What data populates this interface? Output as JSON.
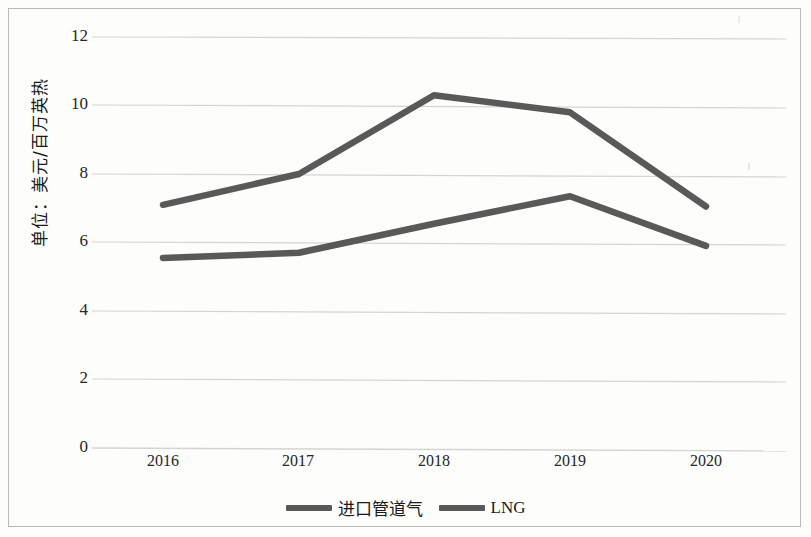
{
  "chart_data": {
    "type": "line",
    "title": "",
    "xlabel": "",
    "ylabel": "单位：美元/百万英热",
    "categories": [
      "2016",
      "2017",
      "2018",
      "2019",
      "2020"
    ],
    "ylim": [
      0,
      12
    ],
    "yticks": [
      0,
      2,
      4,
      6,
      8,
      10,
      12
    ],
    "ytick_labels": [
      "0",
      "2",
      "4",
      "6",
      "8",
      "10",
      "12"
    ],
    "grid": true,
    "legend_position": "bottom",
    "series": [
      {
        "name": "进口管道气",
        "color": "#595959",
        "values": [
          5.55,
          5.7,
          6.55,
          7.35,
          5.9
        ]
      },
      {
        "name": "LNG",
        "color": "#595959",
        "values": [
          7.1,
          8.0,
          10.3,
          9.8,
          7.05
        ]
      }
    ]
  },
  "axis": {
    "y_label_text": "单位：美元/百万英热",
    "y_tick_0": "0",
    "y_tick_2": "2",
    "y_tick_4": "4",
    "y_tick_6": "6",
    "y_tick_8": "8",
    "y_tick_10": "10",
    "y_tick_12": "12",
    "x_tick_2016": "2016",
    "x_tick_2017": "2017",
    "x_tick_2018": "2018",
    "x_tick_2019": "2019",
    "x_tick_2020": "2020"
  },
  "legend": {
    "series_1_label": "进口管道气",
    "series_2_label": "LNG"
  },
  "colors": {
    "line": "#595959",
    "grid": "#d4d4d4",
    "frame": "#b9b9b9",
    "text": "#262626"
  }
}
